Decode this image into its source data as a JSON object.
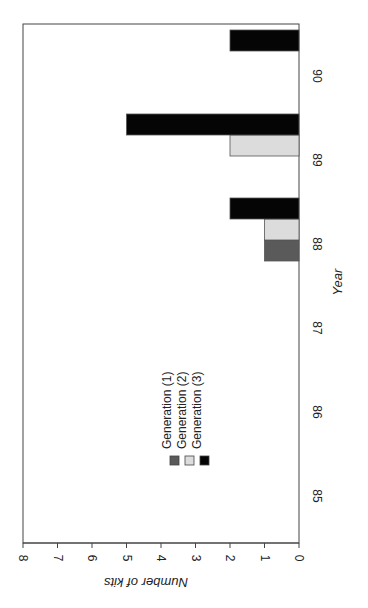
{
  "chart_data": {
    "type": "bar",
    "orientation": "rotated-90-clockwise (vertical bar chart printed sideways)",
    "title": "",
    "xlabel": "Year",
    "ylabel": "Number of kits",
    "categories": [
      "85",
      "86",
      "87",
      "88",
      "89",
      "90"
    ],
    "series": [
      {
        "name": "Generation (1)",
        "color": "#5a5a5a",
        "values": [
          0,
          0,
          0,
          1,
          0,
          0
        ]
      },
      {
        "name": "Generation (2)",
        "color": "#dcdcdc",
        "values": [
          0,
          0,
          0,
          1,
          2,
          0
        ]
      },
      {
        "name": "Generation (3)",
        "color": "#050505",
        "values": [
          0,
          0,
          0,
          2,
          5,
          2
        ]
      }
    ],
    "ylim": [
      0,
      8
    ],
    "yticks": [
      "0",
      "1",
      "2",
      "3",
      "4",
      "5",
      "6",
      "7",
      "8"
    ],
    "grid": false,
    "legend": {
      "position": "inside plot, near categories 86-87",
      "entries": [
        "Generation (1)",
        "Generation (2)",
        "Generation (3)"
      ]
    }
  },
  "labels": {
    "xlabel": "Year",
    "ylabel": "Number of kits",
    "legend": [
      "Generation (1)",
      "Generation (2)",
      "Generation (3)"
    ]
  }
}
